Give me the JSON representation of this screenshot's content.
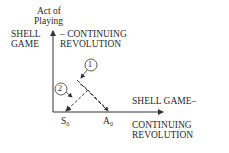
{
  "diagram": {
    "y_axis_label_line1": "Act of",
    "y_axis_label_line2": "Playing",
    "top_left_line1": "SHELL",
    "top_left_line2": "GAME",
    "top_right_line1": "– CONTINUING",
    "top_right_line2": "REVOLUTION",
    "x_axis_label_line1": "SHELL GAME–",
    "x_axis_label_line2": "CONTINUING",
    "x_axis_label_line3": "REVOLUTION",
    "tick_s": "S",
    "tick_s_sub": "0",
    "tick_a": "A",
    "tick_a_sub": "0",
    "marker_1": "1",
    "marker_2": "2"
  }
}
